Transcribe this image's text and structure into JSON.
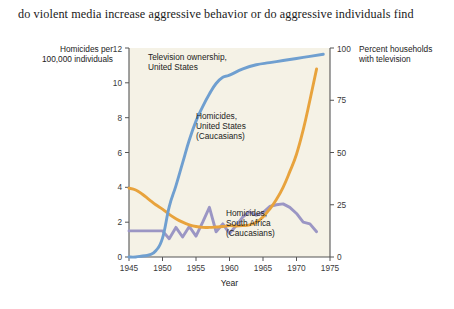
{
  "caption": {
    "text": "do violent media increase aggressive behavior or do aggressive individuals find"
  },
  "chart_data": {
    "type": "line",
    "title": "",
    "xlabel": "Year",
    "ylabel": "Homicides per 100,000 individuals",
    "y2label": "Percent households with television",
    "xlim": [
      1945,
      1975
    ],
    "ylim": [
      0,
      12
    ],
    "y2lim": [
      0,
      100
    ],
    "grid": false,
    "legend_position": "inline-annotations",
    "xticks": [
      "1945",
      "1950",
      "1955",
      "1960",
      "1965",
      "1970",
      "1975"
    ],
    "yticks": [
      "0",
      "2",
      "4",
      "6",
      "8",
      "10",
      "12"
    ],
    "y2ticks": [
      "0",
      "25",
      "50",
      "75",
      "100"
    ],
    "series": [
      {
        "name": "Television ownership, United States",
        "axis": "right",
        "color": "#6f9fd0",
        "x": [
          1945,
          1946,
          1947,
          1948,
          1949,
          1950,
          1951,
          1952,
          1953,
          1954,
          1955,
          1956,
          1957,
          1958,
          1959,
          1960,
          1962,
          1964,
          1966,
          1968,
          1970,
          1972,
          1974
        ],
        "values": [
          0,
          0,
          0.5,
          1,
          3,
          9,
          24,
          34,
          45,
          56,
          65,
          72,
          78,
          83,
          86,
          87,
          90,
          92,
          93,
          94,
          95,
          96,
          97
        ]
      },
      {
        "name": "Homicides, United States (Caucasians)",
        "axis": "left",
        "color": "#e8a33d",
        "x": [
          1945,
          1946,
          1947,
          1948,
          1949,
          1950,
          1951,
          1952,
          1953,
          1954,
          1955,
          1956,
          1957,
          1958,
          1959,
          1960,
          1961,
          1962,
          1963,
          1964,
          1965,
          1966,
          1967,
          1968,
          1969,
          1970,
          1971,
          1972,
          1973
        ],
        "values": [
          3.95,
          3.85,
          3.6,
          3.3,
          3.0,
          2.75,
          2.45,
          2.2,
          2.0,
          1.85,
          1.75,
          1.7,
          1.7,
          1.72,
          1.75,
          1.8,
          1.78,
          1.8,
          1.85,
          2.0,
          2.3,
          2.75,
          3.3,
          4.0,
          4.9,
          5.9,
          7.3,
          9.0,
          10.8
        ]
      },
      {
        "name": "Homicides, South Africa (Caucasians)",
        "axis": "left",
        "color": "#9b96c4",
        "x": [
          1945,
          1946,
          1947,
          1948,
          1949,
          1950,
          1951,
          1952,
          1953,
          1954,
          1955,
          1956,
          1957,
          1958,
          1959,
          1960,
          1961,
          1962,
          1963,
          1964,
          1965,
          1966,
          1967,
          1968,
          1969,
          1970,
          1971,
          1972,
          1973
        ],
        "values": [
          1.5,
          1.5,
          1.5,
          1.5,
          1.5,
          1.5,
          1.05,
          1.7,
          1.15,
          1.75,
          1.2,
          2.0,
          2.85,
          1.45,
          1.9,
          1.35,
          1.8,
          2.3,
          2.6,
          2.4,
          2.55,
          2.9,
          3.0,
          3.05,
          2.85,
          2.5,
          2.0,
          1.9,
          1.45
        ]
      }
    ],
    "annotations": [
      {
        "name": "tv-ownership-label",
        "lines": [
          "Television ownership,",
          "United States"
        ]
      },
      {
        "name": "us-homicides-label",
        "lines": [
          "Homicides,",
          "United States",
          "(Caucasians)"
        ]
      },
      {
        "name": "sa-homicides-label",
        "lines": [
          "Homicides,",
          "South Africa",
          "(Caucasians)"
        ]
      }
    ],
    "colors": {
      "plot_background": "#f5f2e6",
      "axis": "#555555",
      "tv_ownership": "#6f9fd0",
      "us_homicides": "#e8a33d",
      "sa_homicides": "#9b96c4"
    }
  }
}
